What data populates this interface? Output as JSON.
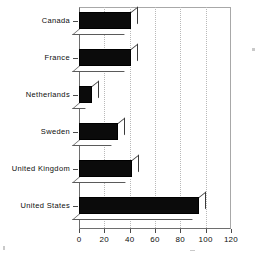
{
  "chart_data": {
    "type": "bar",
    "orientation": "horizontal",
    "title": "",
    "xlabel": "",
    "ylabel": "",
    "categories": [
      "Canada",
      "France",
      "Netherlands",
      "Sweden",
      "United Kingdom",
      "United States"
    ],
    "values": [
      41,
      41,
      10,
      31,
      42,
      95
    ],
    "xlim": [
      0,
      120
    ],
    "xticks": [
      0,
      20,
      40,
      60,
      80,
      100,
      120
    ],
    "xtick_labels": [
      "0",
      "20",
      "40",
      "60",
      "80",
      "100",
      "120"
    ],
    "grid": "vertical-dotted",
    "legend": "none",
    "bar_style": "3d-extruded",
    "bar_color": "#0b0b0b",
    "grid_color": "#b9b9b9",
    "frame_color": "#6e6e6e"
  },
  "axis": {
    "x_ticks": [
      {
        "label": "0",
        "value": 0
      },
      {
        "label": "20",
        "value": 20
      },
      {
        "label": "40",
        "value": 40
      },
      {
        "label": "60",
        "value": 60
      },
      {
        "label": "80",
        "value": 80
      },
      {
        "label": "100",
        "value": 100
      },
      {
        "label": "120",
        "value": 120
      }
    ],
    "y_categories": [
      {
        "label": "Canada",
        "value": 41
      },
      {
        "label": "France",
        "value": 41
      },
      {
        "label": "Netherlands",
        "value": 10
      },
      {
        "label": "Sweden",
        "value": 31
      },
      {
        "label": "United Kingdom",
        "value": 42
      },
      {
        "label": "United States",
        "value": 95
      }
    ]
  }
}
